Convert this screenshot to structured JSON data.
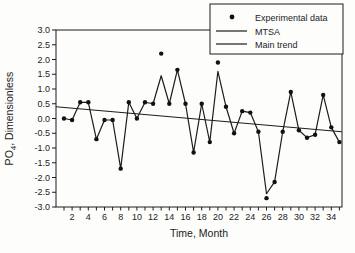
{
  "figure": {
    "background": "#fdfdfc",
    "ink_color": "#1c1c1c",
    "marker_color": "#111111"
  },
  "chart_data": {
    "type": "line",
    "title": "",
    "xlabel": "Time, Month",
    "ylabel": "PO4, Dimensionless",
    "ylabel_parts": {
      "prefix": "PO",
      "subscript": "4",
      "suffix": ", Dimensionless"
    },
    "xlim": [
      0,
      35.3
    ],
    "ylim": [
      -3.0,
      3.0
    ],
    "grid": false,
    "frame": true,
    "y_ticks": [
      {
        "value": 3.0,
        "label": "3.0"
      },
      {
        "value": 2.5,
        "label": "2.5"
      },
      {
        "value": 2.0,
        "label": "2.0"
      },
      {
        "value": 1.5,
        "label": "1.5"
      },
      {
        "value": 1.0,
        "label": "1.0"
      },
      {
        "value": 0.5,
        "label": "0.5"
      },
      {
        "value": 0.0,
        "label": "0.0"
      },
      {
        "value": -0.5,
        "label": "-0.5"
      },
      {
        "value": -1.0,
        "label": "-1.0"
      },
      {
        "value": -1.5,
        "label": "-1.5"
      },
      {
        "value": -2.0,
        "label": "-2.0"
      },
      {
        "value": -2.5,
        "label": "-2.5"
      },
      {
        "value": -3.0,
        "label": "-3.0"
      }
    ],
    "x_minor_tick_months": [
      1,
      3,
      5,
      7,
      9,
      11,
      13,
      15,
      17,
      19,
      21,
      23,
      25,
      27,
      29,
      31,
      33,
      35
    ],
    "x_labeled_months": [
      2,
      4,
      6,
      8,
      10,
      12,
      14,
      16,
      18,
      20,
      22,
      24,
      26,
      28,
      30,
      32,
      34
    ],
    "months": [
      1,
      2,
      3,
      4,
      5,
      6,
      7,
      8,
      9,
      10,
      11,
      12,
      13,
      14,
      15,
      16,
      17,
      18,
      19,
      20,
      21,
      22,
      23,
      24,
      25,
      26,
      27,
      28,
      29,
      30,
      31,
      32,
      33,
      34,
      35
    ],
    "series": [
      {
        "name": "Experimental data",
        "style": "scatter",
        "marker": "filled-circle",
        "values": [
          0.0,
          -0.05,
          0.55,
          0.55,
          -0.7,
          -0.05,
          -0.05,
          -1.7,
          0.55,
          0.0,
          0.55,
          0.5,
          2.2,
          0.5,
          1.65,
          0.5,
          -1.15,
          0.5,
          -0.8,
          1.9,
          0.4,
          -0.5,
          0.25,
          0.2,
          -0.45,
          -2.7,
          -2.15,
          -0.45,
          0.9,
          -0.4,
          -0.65,
          -0.55,
          0.8,
          -0.3,
          -0.8
        ]
      },
      {
        "name": "MTSA",
        "style": "line",
        "values": [
          0.0,
          -0.05,
          0.55,
          0.55,
          -0.7,
          -0.05,
          -0.05,
          -1.7,
          0.55,
          0.0,
          0.55,
          0.5,
          1.45,
          0.5,
          1.65,
          0.5,
          -1.15,
          0.5,
          -0.8,
          1.6,
          0.4,
          -0.5,
          0.25,
          0.2,
          -0.45,
          -2.55,
          -2.15,
          -0.45,
          0.9,
          -0.4,
          -0.65,
          -0.55,
          0.8,
          -0.3,
          -0.8
        ]
      },
      {
        "name": "Main trend",
        "style": "line",
        "trend_line": {
          "start_month": 0,
          "start_value": 0.4,
          "end_month": 35.3,
          "end_value": -0.45
        }
      }
    ],
    "legend": {
      "position": "top-right",
      "entries": [
        {
          "label": "Experimental data",
          "marker": "dot"
        },
        {
          "label": "MTSA",
          "marker": "line"
        },
        {
          "label": "Main trend",
          "marker": "line"
        }
      ]
    }
  }
}
